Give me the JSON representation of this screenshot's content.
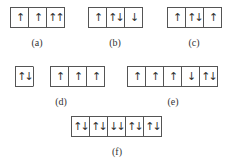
{
  "diagrams": [
    {
      "id": "a",
      "label": "(a)",
      "boxes": [
        "↑",
        "↑",
        "↑↑"
      ]
    },
    {
      "id": "b",
      "label": "(b)",
      "boxes": [
        "↑",
        "↑↓",
        "↓"
      ]
    },
    {
      "id": "c",
      "label": "(c)",
      "boxes": [
        "↑",
        "↑↓",
        "↑"
      ]
    },
    {
      "id": "d",
      "label": "(d)",
      "boxes": [
        "↑↓",
        "",
        "↑",
        "↑",
        "↑"
      ]
    },
    {
      "id": "e",
      "label": "(e)",
      "boxes": [
        "↑",
        "↑",
        "↑",
        "↓",
        "↑↓"
      ]
    },
    {
      "id": "f",
      "label": "(f)",
      "boxes": [
        "↑↓",
        "↑↓",
        "↓↓",
        "↑↓",
        "↑↓"
      ]
    }
  ]
}
